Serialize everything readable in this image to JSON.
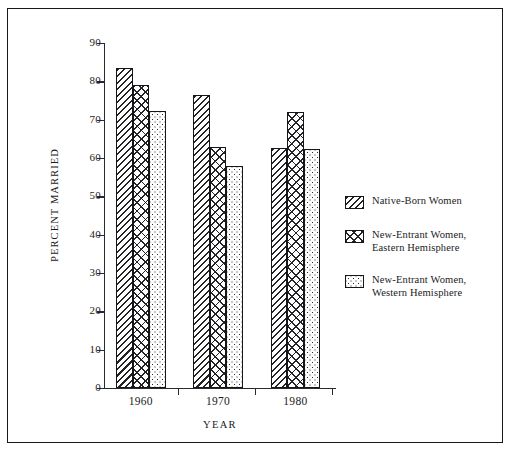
{
  "chart_data": {
    "type": "bar",
    "title": "",
    "xlabel": "YEAR",
    "ylabel": "PERCENT MARRIED",
    "categories": [
      "1960",
      "1970",
      "1980"
    ],
    "ylim": [
      0,
      90
    ],
    "yticks": [
      0,
      10,
      20,
      30,
      40,
      50,
      60,
      70,
      80,
      90
    ],
    "ytick_labels": [
      "0",
      "10",
      "20",
      "30",
      "40",
      "50",
      "60",
      "70",
      "80",
      "90"
    ],
    "grid": false,
    "legend_position": "right",
    "series": [
      {
        "name": "Native-Born Women",
        "pattern": "diagonal-hatch",
        "values": [
          83.5,
          76.5,
          62.5
        ]
      },
      {
        "name": "New-Entrant Women,\nEastern Hemisphere",
        "pattern": "cross-hatch",
        "values": [
          79.0,
          63.0,
          72.0
        ]
      },
      {
        "name": "New-Entrant Women,\nWestern Hemisphere",
        "pattern": "stipple-dots",
        "values": [
          72.3,
          57.8,
          62.3
        ]
      }
    ]
  },
  "colors": {
    "ink": "#17171a",
    "paper": "#ffffff"
  }
}
